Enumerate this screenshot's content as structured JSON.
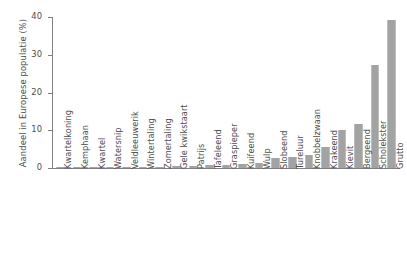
{
  "chart_data": {
    "type": "bar",
    "title": "",
    "xlabel": "",
    "ylabel": "Aandeel in Europese populatie (%)",
    "ylim": [
      0,
      40
    ],
    "yticks": [
      0,
      10,
      20,
      30,
      40
    ],
    "grid": false,
    "legend": null,
    "bar_color": "#a3a3a3",
    "axis_color": "#808080",
    "text_color": "#4d4d4d",
    "categories": [
      "Kwartelkoning",
      "Kemphaan",
      "Kwartel",
      "Watersnip",
      "Veldleeuwerik",
      "Wintertaling",
      "Zomertaling",
      "Gele kwikstaart",
      "Patrijs",
      "Tafeleend",
      "Graspieper",
      "Kuifeend",
      "Wulp",
      "Slobeend",
      "Tureluur",
      "Knobbelzwaan",
      "Krakeend",
      "Kievit",
      "Bergeend",
      "Scholekster",
      "Grutto"
    ],
    "values": [
      0.1,
      0.1,
      0.15,
      0.2,
      0.25,
      0.3,
      0.4,
      0.5,
      0.6,
      0.7,
      0.8,
      1.1,
      1.3,
      2.6,
      2.9,
      3.4,
      5.6,
      10.0,
      11.7,
      27.3,
      39.2
    ]
  }
}
